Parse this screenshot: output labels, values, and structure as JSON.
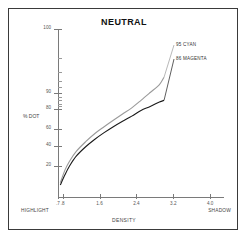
{
  "chart_data": {
    "type": "line",
    "title": "NEUTRAL",
    "xlabel": "DENSITY",
    "ylabel": "% DOT",
    "xlim": [
      0.7,
      4.3
    ],
    "ylim": [
      5,
      102
    ],
    "yscale": "logit-like",
    "grid": false,
    "legend_position": "inline-right",
    "x_axis_end_labels": {
      "left": "HIGHLIGHT",
      "right": "SHADOW"
    },
    "xticks": [
      0.7,
      0.8,
      1.6,
      2.4,
      3.2,
      4.0
    ],
    "xtick_labels": [
      ".7",
      ".8",
      "1.6",
      "2.4",
      "3.2",
      "4.0"
    ],
    "yticks": [
      20,
      40,
      60,
      80,
      90,
      100
    ],
    "ytick_labels": [
      "20",
      "40",
      "60",
      "80",
      "90",
      "100"
    ],
    "yticks_minor": [
      82,
      84,
      86,
      88,
      92,
      94,
      96,
      98
    ],
    "series": [
      {
        "name": "95 CYAN",
        "color": "#9a9a9a",
        "label": "95 CYAN",
        "x": [
          0.75,
          0.85,
          0.95,
          1.1,
          1.3,
          1.5,
          1.7,
          1.9,
          2.1,
          2.3,
          2.5,
          2.7,
          2.9,
          3.0
        ],
        "y": [
          10,
          17,
          24,
          34,
          45,
          55,
          63,
          70,
          76,
          81,
          86,
          90,
          93,
          95
        ]
      },
      {
        "name": "86 MAGENTA",
        "color": "#1a1a1a",
        "label": "86 MAGENTA",
        "x": [
          0.75,
          0.85,
          0.95,
          1.1,
          1.3,
          1.5,
          1.7,
          1.9,
          2.1,
          2.3,
          2.5,
          2.7,
          2.9,
          3.0
        ],
        "y": [
          9,
          14,
          20,
          29,
          39,
          48,
          56,
          63,
          69,
          74,
          79,
          82,
          85,
          86
        ]
      }
    ]
  }
}
